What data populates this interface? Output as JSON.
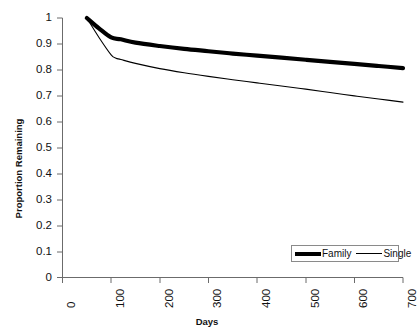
{
  "chart_data": {
    "type": "line",
    "title": "",
    "xlabel": "Days",
    "ylabel": "Proportion Remaining",
    "xlim": [
      0,
      700
    ],
    "ylim": [
      0,
      1
    ],
    "grid": false,
    "legend_position": "bottom-right",
    "x_ticks": [
      "0",
      "100",
      "200",
      "300",
      "400",
      "500",
      "600",
      "700"
    ],
    "y_ticks": [
      "0",
      "0.1",
      "0.2",
      "0.3",
      "0.4",
      "0.5",
      "0.6",
      "0.7",
      "0.8",
      "0.9",
      "1"
    ],
    "series": [
      {
        "name": "Family",
        "color": "#000000",
        "line_width": 4,
        "x": [
          50,
          75,
          100,
          120,
          150,
          200,
          250,
          300,
          350,
          400,
          450,
          500,
          550,
          600,
          650,
          700
        ],
        "values": [
          1.0,
          0.96,
          0.925,
          0.918,
          0.905,
          0.892,
          0.881,
          0.872,
          0.863,
          0.855,
          0.847,
          0.839,
          0.831,
          0.823,
          0.815,
          0.807
        ]
      },
      {
        "name": "Single",
        "color": "#000000",
        "line_width": 1,
        "x": [
          50,
          75,
          100,
          110,
          120,
          150,
          200,
          250,
          300,
          350,
          400,
          450,
          500,
          550,
          600,
          650,
          700
        ],
        "values": [
          1.0,
          0.925,
          0.858,
          0.845,
          0.84,
          0.825,
          0.805,
          0.789,
          0.775,
          0.762,
          0.75,
          0.738,
          0.726,
          0.713,
          0.7,
          0.688,
          0.676
        ]
      }
    ]
  },
  "axes": {
    "y_title": "Proportion Remaining",
    "x_title": "Days",
    "y_labels": [
      "1",
      "0.9",
      "0.8",
      "0.7",
      "0.6",
      "0.5",
      "0.4",
      "0.3",
      "0.2",
      "0.1",
      "0"
    ],
    "x_labels": [
      "0",
      "100",
      "200",
      "300",
      "400",
      "500",
      "600",
      "700"
    ]
  },
  "legend": {
    "items": [
      {
        "label": "Family",
        "style": "thick"
      },
      {
        "label": "Single",
        "style": "thin"
      }
    ]
  },
  "colors": {
    "line": "#000000",
    "axis": "#6b6b6b",
    "text": "#111111",
    "background": "#ffffff"
  }
}
